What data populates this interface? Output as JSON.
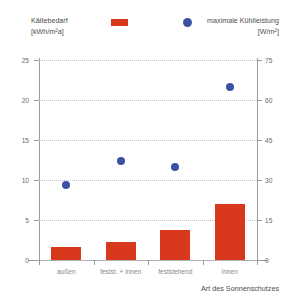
{
  "chart_data": {
    "type": "bar",
    "title": "",
    "categories": [
      "außen",
      "festst. + innen",
      "feststehend",
      "innen"
    ],
    "xlabel": "Art des Sonnenschutzes",
    "series": [
      {
        "name": "Kältebedarf",
        "unit": "[kWh/m²a]",
        "type": "bar",
        "axis": "left",
        "color": "#d8381c",
        "values": [
          1.6,
          2.2,
          3.8,
          7.0
        ]
      },
      {
        "name": "maximale Kühlleistung",
        "unit": "[W/m²]",
        "type": "scatter",
        "axis": "right",
        "color": "#3a52a4",
        "values": [
          28,
          37,
          35,
          65
        ]
      }
    ],
    "left_axis": {
      "label": "Kältebedarf [kWh/m²a]",
      "ticks": [
        0,
        5,
        10,
        15,
        20,
        25
      ],
      "ylim": [
        0,
        25
      ]
    },
    "right_axis": {
      "label": "maximale Kühlleistung [W/m²]",
      "ticks": [
        0,
        15,
        30,
        45,
        60,
        75
      ],
      "ylim": [
        0,
        75
      ]
    },
    "grid": true,
    "legend_position": "top"
  },
  "legend": {
    "left": {
      "name": "Kältebedarf",
      "unit": "[kWh/m²a]",
      "marker": "red-square-marker"
    },
    "right": {
      "name": "maximale Kühlleistung",
      "unit": "[W/m²]",
      "marker": "blue-circle-marker"
    }
  },
  "colors": {
    "bar": "#d8381c",
    "dot": "#3a52a4",
    "axis": "#9a9a9a",
    "grid": "#bfc3d4",
    "text": "#6b6b6b"
  }
}
